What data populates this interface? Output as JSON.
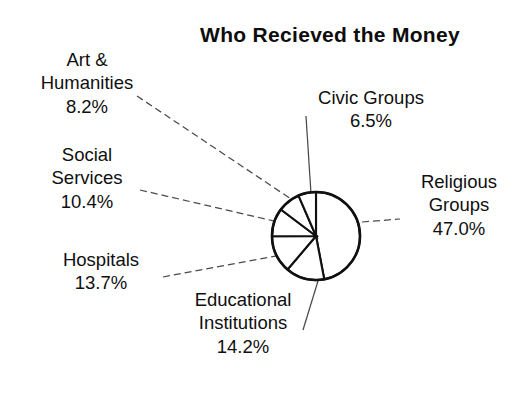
{
  "chart_data": {
    "type": "pie",
    "title": "Who Recieved the Money",
    "xlabel": "",
    "ylabel": "",
    "legend_position": "none",
    "grid": false,
    "labels_outside": true,
    "categories": [
      "Religious Groups",
      "Educational Institutions",
      "Hospitals",
      "Social Services",
      "Art & Humanities",
      "Civic Groups"
    ],
    "values": [
      47.0,
      14.2,
      13.7,
      10.4,
      8.2,
      6.5
    ],
    "value_suffix": "%",
    "start_angle_deg": 0,
    "direction": "clockwise",
    "slices": [
      {
        "name": "Religious Groups",
        "value": 47.0,
        "value_text": "47.0%",
        "start_deg": 0.0,
        "sweep_deg": 169.2,
        "fill": "#ffffff",
        "stroke": "#111111"
      },
      {
        "name": "Educational Institutions",
        "value": 14.2,
        "value_text": "14.2%",
        "start_deg": 169.2,
        "sweep_deg": 51.12,
        "fill": "#ffffff",
        "stroke": "#111111"
      },
      {
        "name": "Hospitals",
        "value": 13.7,
        "value_text": "13.7%",
        "start_deg": 220.32,
        "sweep_deg": 49.32,
        "fill": "#ffffff",
        "stroke": "#111111"
      },
      {
        "name": "Social Services",
        "value": 10.4,
        "value_text": "10.4%",
        "start_deg": 269.64,
        "sweep_deg": 37.44,
        "fill": "#ffffff",
        "stroke": "#111111"
      },
      {
        "name": "Art & Humanities",
        "value": 8.2,
        "value_text": "8.2%",
        "start_deg": 307.08,
        "sweep_deg": 29.52,
        "fill": "#ffffff",
        "stroke": "#111111"
      },
      {
        "name": "Civic Groups",
        "value": 6.5,
        "value_text": "6.5%",
        "start_deg": 336.6,
        "sweep_deg": 23.4,
        "fill": "#ffffff",
        "stroke": "#111111"
      }
    ],
    "geometry": {
      "cx": 316,
      "cy": 236,
      "r": 44
    }
  },
  "labels": {
    "art": {
      "line1": "Art &",
      "line2": "Humanities",
      "percent": "8.2%"
    },
    "social": {
      "line1": "Social",
      "line2": "Services",
      "percent": "10.4%"
    },
    "hospitals": {
      "line1": "Hospitals",
      "line2": "",
      "percent": "13.7%"
    },
    "education": {
      "line1": "Educational",
      "line2": "Institutions",
      "percent": "14.2%"
    },
    "civic": {
      "line1": "Civic Groups",
      "line2": "",
      "percent": "6.5%"
    },
    "religious": {
      "line1": "Religious",
      "line2": "Groups",
      "percent": "47.0%"
    }
  },
  "colors": {
    "background": "#ffffff",
    "ink": "#111111",
    "leader": "#4a4a4a"
  }
}
